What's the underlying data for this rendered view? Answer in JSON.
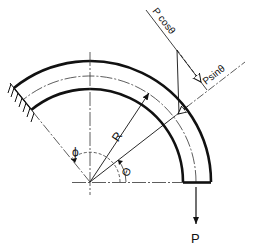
{
  "diagram": {
    "type": "curved-beam-free-body",
    "labels": {
      "p_cos": "P cosθ",
      "p_sin": "Psinθ",
      "radius": "R",
      "phi": "ϕ",
      "theta": "Θ",
      "load": "P"
    },
    "colors": {
      "stroke": "#111111",
      "background": "#ffffff"
    },
    "geometry": {
      "center": [
        90,
        182
      ],
      "inner_radius": 93,
      "centerline_radius": 106,
      "outer_radius": 121,
      "arc_start_deg": 0,
      "arc_end_deg": 129,
      "load_point_angle_deg": 38
    }
  }
}
